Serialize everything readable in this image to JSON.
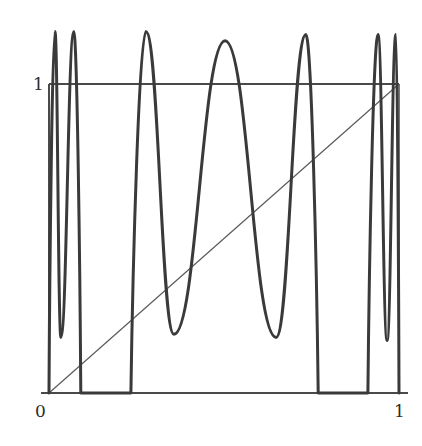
{
  "chart_data": {
    "type": "line",
    "title": "",
    "xlabel": "",
    "ylabel": "",
    "xlim": [
      0,
      1
    ],
    "ylim": [
      0,
      1
    ],
    "grid": false,
    "legend": null,
    "x_tick_labels": [
      "0",
      "1"
    ],
    "y_tick_labels": [
      "1"
    ],
    "series": [
      {
        "name": "map",
        "style": "thick",
        "points": [
          [
            0.0,
            0.0
          ],
          [
            0.017,
            1.17
          ],
          [
            0.034,
            0.18
          ],
          [
            0.071,
            1.17
          ],
          [
            0.091,
            0.0
          ],
          [
            0.234,
            0.0
          ],
          [
            0.277,
            1.17
          ],
          [
            0.357,
            0.19
          ],
          [
            0.503,
            1.14
          ],
          [
            0.649,
            0.18
          ],
          [
            0.734,
            1.16
          ],
          [
            0.769,
            0.0
          ],
          [
            0.911,
            0.0
          ],
          [
            0.94,
            1.16
          ],
          [
            0.966,
            0.17
          ],
          [
            0.991,
            1.16
          ],
          [
            1.0,
            0.0
          ]
        ]
      },
      {
        "name": "diagonal y=x",
        "style": "thin",
        "points": [
          [
            0,
            0
          ],
          [
            1,
            1
          ]
        ]
      },
      {
        "name": "level y=1",
        "style": "medium",
        "points": [
          [
            0,
            1
          ],
          [
            1,
            1
          ]
        ]
      }
    ]
  },
  "axes": {
    "origin_label": "0",
    "x_end_label": "1",
    "y_end_label": "1"
  },
  "colors": {
    "curve": "#3a3a3a",
    "axes": "#4a4a4a",
    "diagonal": "#5a5a5a",
    "background": "#ffffff"
  }
}
